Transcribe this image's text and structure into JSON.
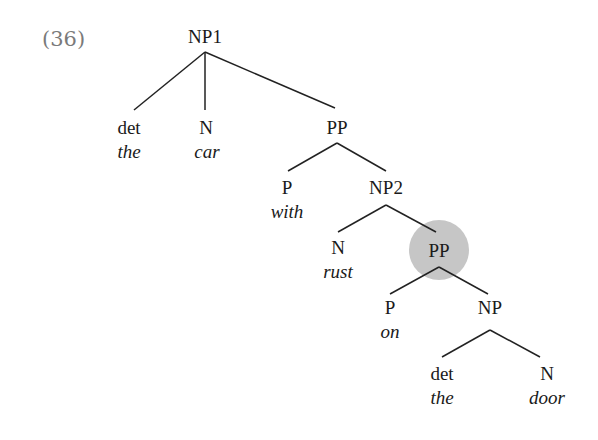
{
  "example_number": "(36)",
  "highlight_color": "#c6c6c6",
  "nodes": {
    "np1": {
      "label": "NP1"
    },
    "det1": {
      "label": "det",
      "word": "the"
    },
    "n1": {
      "label": "N",
      "word": "car"
    },
    "pp1": {
      "label": "PP"
    },
    "p1": {
      "label": "P",
      "word": "with"
    },
    "np2": {
      "label": "NP2"
    },
    "n2": {
      "label": "N",
      "word": "rust"
    },
    "pp2": {
      "label": "PP",
      "highlighted": true
    },
    "p2": {
      "label": "P",
      "word": "on"
    },
    "np3": {
      "label": "NP"
    },
    "det2": {
      "label": "det",
      "word": "the"
    },
    "n3": {
      "label": "N",
      "word": "door"
    }
  }
}
